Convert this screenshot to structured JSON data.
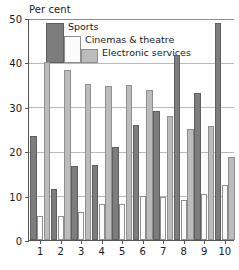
{
  "chart_data": {
    "type": "bar",
    "title": "",
    "ylabel": "Per cent",
    "xlabel": "",
    "ylim": [
      0,
      50
    ],
    "yticks": [
      0,
      10,
      20,
      30,
      40,
      50
    ],
    "grid": true,
    "legend_position": "inside-top-left",
    "categories": [
      "1",
      "2",
      "3",
      "4",
      "5",
      "6",
      "7",
      "8",
      "9",
      "10"
    ],
    "series": [
      {
        "name": "Sports",
        "color": "#7d7d7d",
        "values": [
          23.5,
          11.5,
          16.7,
          16.8,
          21.0,
          26.0,
          29.0,
          41.6,
          33.2,
          48.8
        ]
      },
      {
        "name": "Cinemas & theatre",
        "color": "#fbfbfb",
        "values": [
          5.5,
          5.5,
          6.4,
          8.2,
          8.1,
          10.0,
          9.7,
          8.9,
          10.3,
          12.5
        ]
      },
      {
        "name": "Electronic services",
        "color": "#bcbcbc",
        "values": [
          40.0,
          38.2,
          35.2,
          34.8,
          35.0,
          33.7,
          28.0,
          25.1,
          25.6,
          18.7
        ]
      }
    ]
  },
  "axis": {
    "y_title": "Per cent"
  },
  "legend": {
    "items": [
      {
        "label": "Sports",
        "swatch": "sports-swatch"
      },
      {
        "label": "Cinemas & theatre",
        "swatch": "cinemas-swatch"
      },
      {
        "label": "Electronic services",
        "swatch": "electronic-swatch"
      }
    ]
  }
}
